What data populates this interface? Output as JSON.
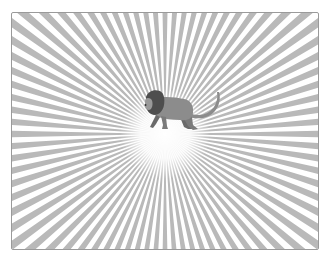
{
  "scene": {
    "subject": "lion walking",
    "background": "radiating sunburst rays",
    "colors": {
      "background": "#ffffff",
      "rays": "#b9b9b9",
      "frame_border": "#9a9a9a",
      "glow": "#ffffff",
      "lion_body": "#8c8c8c",
      "lion_mane": "#4e4e4e",
      "lion_dark": "#6a6a6a"
    },
    "ray_count": 80,
    "center": [
      153,
      121
    ]
  }
}
